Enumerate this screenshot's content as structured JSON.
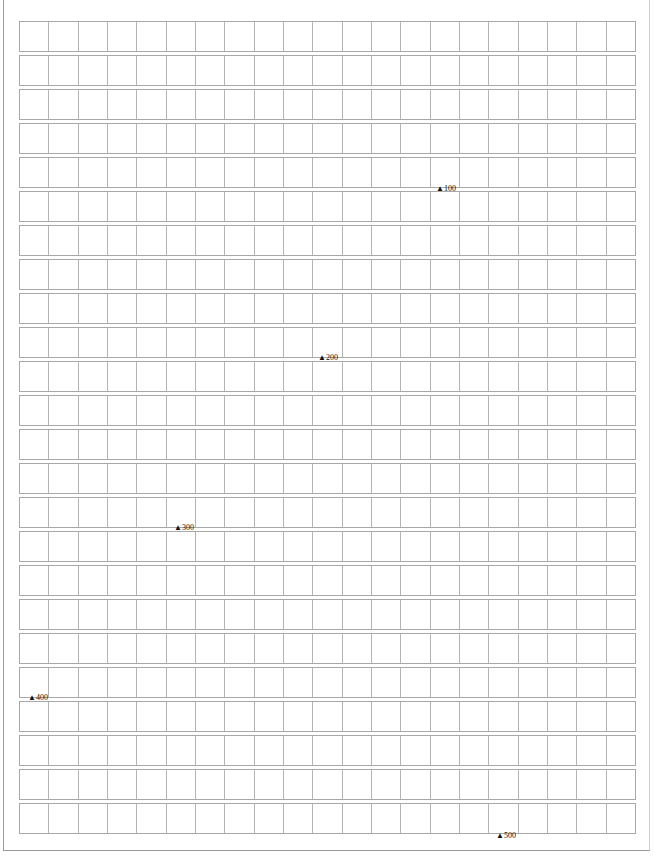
{
  "paper": {
    "type": "manuscript-grid",
    "rows": 24,
    "columns": 21,
    "grid_line_color": "#a8a8a8",
    "background": "#ffffff"
  },
  "markers": [
    {
      "label": "100",
      "symbol": "▲",
      "x": 436,
      "y": 185
    },
    {
      "label": "200",
      "symbol": "▲",
      "x": 318,
      "y": 354
    },
    {
      "label": "300",
      "symbol": "▲",
      "x": 174,
      "y": 524
    },
    {
      "label": "400",
      "symbol": "▲",
      "x": 28,
      "y": 694
    },
    {
      "label": "500",
      "symbol": "▲",
      "x": 496,
      "y": 832
    }
  ]
}
